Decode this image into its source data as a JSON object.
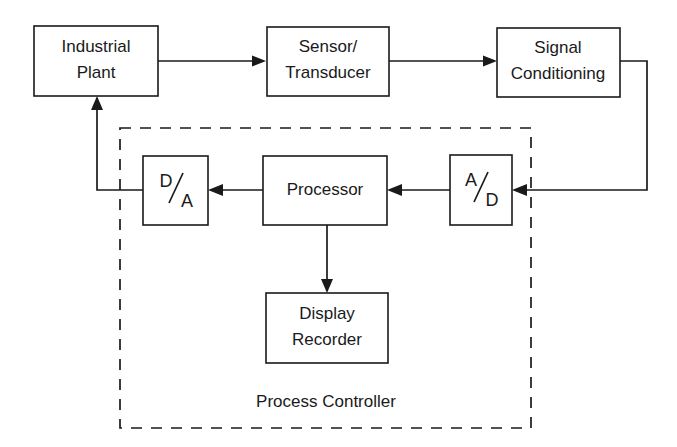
{
  "diagram": {
    "colors": {
      "stroke": "#1a1a1a",
      "fill": "#ffffff",
      "background": "#ffffff"
    },
    "blocks": [
      {
        "id": "industrial-plant",
        "line1": "Industrial",
        "line2": "Plant"
      },
      {
        "id": "sensor-transducer",
        "line1": "Sensor/",
        "line2": "Transducer"
      },
      {
        "id": "signal-conditioning",
        "line1": "Signal",
        "line2": "Conditioning"
      },
      {
        "id": "da-converter",
        "numerator": "D",
        "denominator": "A",
        "separator": "/"
      },
      {
        "id": "processor",
        "line1": "Processor",
        "line2": ""
      },
      {
        "id": "ad-converter",
        "numerator": "A",
        "denominator": "D",
        "separator": "/"
      },
      {
        "id": "display-recorder",
        "line1": "Display",
        "line2": "Recorder"
      }
    ],
    "group": {
      "id": "process-controller",
      "label": "Process Controller",
      "style": "dashed"
    },
    "connections": [
      {
        "from": "industrial-plant",
        "to": "sensor-transducer",
        "direction": "right"
      },
      {
        "from": "sensor-transducer",
        "to": "signal-conditioning",
        "direction": "right"
      },
      {
        "from": "signal-conditioning",
        "to": "ad-converter",
        "direction": "down-left"
      },
      {
        "from": "ad-converter",
        "to": "processor",
        "direction": "left"
      },
      {
        "from": "processor",
        "to": "da-converter",
        "direction": "left"
      },
      {
        "from": "processor",
        "to": "display-recorder",
        "direction": "down"
      },
      {
        "from": "da-converter",
        "to": "industrial-plant",
        "direction": "left-up"
      }
    ]
  }
}
